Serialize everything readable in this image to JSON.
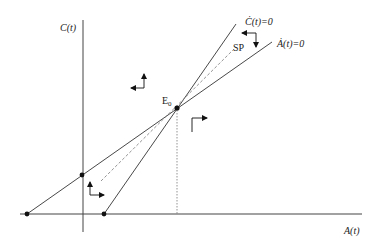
{
  "diagram": {
    "type": "phase_diagram",
    "axes": {
      "y_label": "C(t)",
      "x_label": "A(t)"
    },
    "curves": {
      "c_dot_nullcline": "Ċ(t)=0",
      "a_dot_nullcline": "Ȧ(t)=0",
      "saddle_path": "SP"
    },
    "points": {
      "equilibrium": "E0",
      "equilibrium_main": "E",
      "equilibrium_sub": "0"
    },
    "colors": {
      "line": "#333333",
      "axis": "#444444",
      "dot": "#111111",
      "dashed": "#888888"
    }
  }
}
